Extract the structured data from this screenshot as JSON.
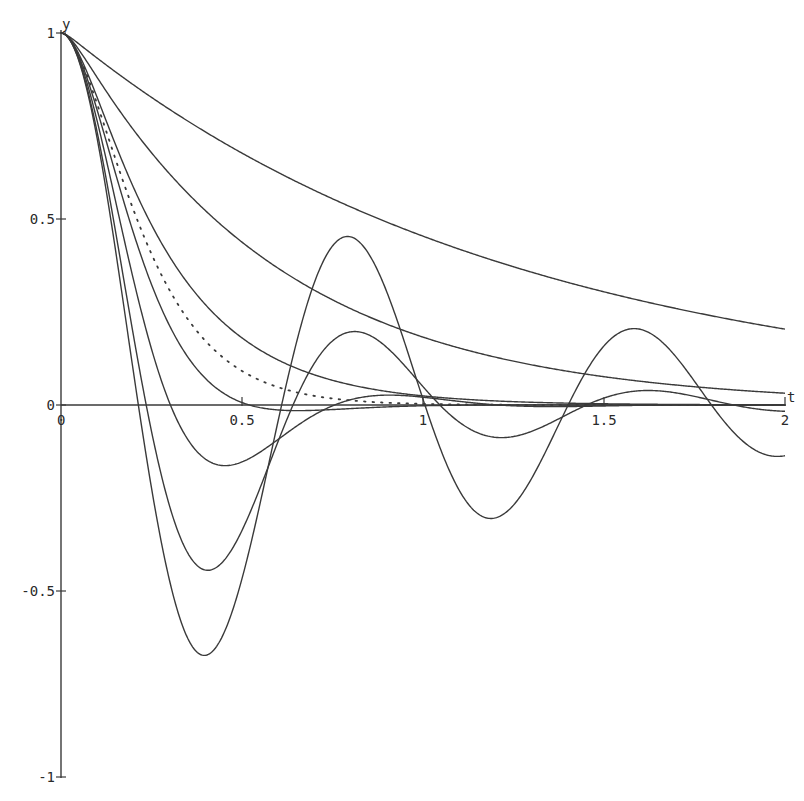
{
  "chart_data": {
    "type": "line",
    "title": "",
    "xlabel": "t",
    "ylabel": "y",
    "xlim": [
      0,
      2
    ],
    "ylim": [
      -1,
      1
    ],
    "grid": false,
    "legend": null,
    "x_ticks": [
      {
        "value": 0,
        "label": "0"
      },
      {
        "value": 0.5,
        "label": "0.5"
      },
      {
        "value": 1,
        "label": "1"
      },
      {
        "value": 1.5,
        "label": "1.5"
      },
      {
        "value": 2,
        "label": "2"
      }
    ],
    "y_ticks": [
      {
        "value": 1,
        "label": "1"
      },
      {
        "value": 0.5,
        "label": "0.5"
      },
      {
        "value": 0,
        "label": "0"
      },
      {
        "value": -0.5,
        "label": "-0.5"
      },
      {
        "value": -1,
        "label": "-1"
      }
    ],
    "model": "y'' + 2*sigma*y' + 64*y = 0, y(0)=1, y'(0)=0",
    "series": [
      {
        "name": "sigma=40.4 (overdamped)",
        "sigma": 40.4,
        "style": "solid",
        "key_points": [
          [
            0,
            1
          ],
          [
            0.52,
            0.66
          ],
          [
            1.35,
            0.34
          ],
          [
            2,
            0.2
          ]
        ]
      },
      {
        "name": "sigma=19.16 (overdamped)",
        "sigma": 19.16,
        "style": "solid",
        "key_points": [
          [
            0,
            1
          ],
          [
            0.52,
            0.41
          ],
          [
            1,
            0.17
          ],
          [
            2,
            0.03
          ]
        ]
      },
      {
        "name": "sigma=10 (overdamped)",
        "sigma": 10,
        "style": "solid",
        "key_points": [
          [
            0,
            1
          ],
          [
            0.47,
            0.21
          ],
          [
            1,
            0.025
          ],
          [
            2,
            0.0
          ]
        ]
      },
      {
        "name": "sigma=8 (critically damped)",
        "sigma": 8,
        "style": "dotted",
        "key_points": [
          [
            0,
            1
          ],
          [
            0.3,
            0.31
          ],
          [
            0.5,
            0.09
          ],
          [
            1,
            0.003
          ]
        ]
      },
      {
        "name": "sigma=6.4 (underdamped)",
        "sigma": 6.4,
        "style": "solid",
        "key_points": [
          [
            0,
            1
          ],
          [
            0.48,
            0.0
          ],
          [
            0.65,
            -0.015
          ],
          [
            2,
            0.0
          ]
        ]
      },
      {
        "name": "sigma=4 (underdamped)",
        "sigma": 4,
        "style": "solid",
        "key_points": [
          [
            0,
            1
          ],
          [
            0.45,
            -0.16
          ],
          [
            0.9,
            0.03
          ],
          [
            2,
            0.0
          ]
        ]
      },
      {
        "name": "sigma=2 (underdamped)",
        "sigma": 2,
        "style": "solid",
        "key_points": [
          [
            0,
            1
          ],
          [
            0.41,
            -0.44
          ],
          [
            0.81,
            0.2
          ],
          [
            1.2,
            -0.09
          ],
          [
            1.62,
            0.035
          ],
          [
            2,
            -0.02
          ]
        ]
      },
      {
        "name": "sigma=1 (underdamped)",
        "sigma": 1,
        "style": "solid",
        "key_points": [
          [
            0,
            1
          ],
          [
            0.39,
            -0.67
          ],
          [
            0.79,
            0.45
          ],
          [
            1.18,
            -0.3
          ],
          [
            1.59,
            0.2
          ],
          [
            2,
            -0.14
          ]
        ]
      }
    ],
    "omega0": 8
  },
  "axes": {
    "x_label": "t",
    "y_label": "y"
  }
}
